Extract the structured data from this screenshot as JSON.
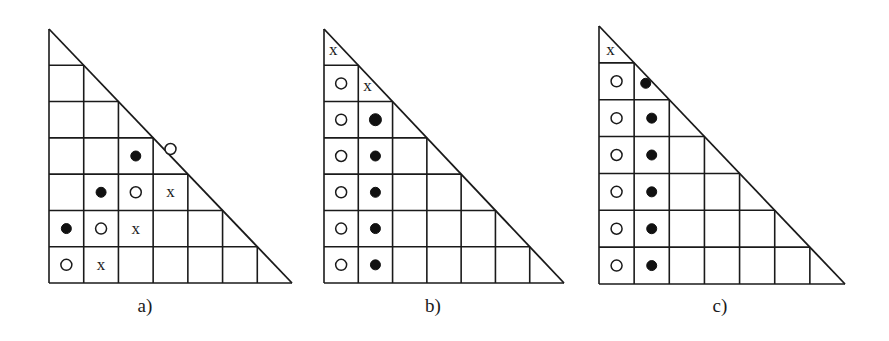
{
  "figure": {
    "colors": {
      "ink": "#1a1a1a",
      "background": "#ffffff"
    },
    "legend_symbols": {
      "open": "open-circle",
      "filled": "filled-circle",
      "x": "x"
    },
    "panels": [
      {
        "id": "a",
        "label": "a)",
        "box": {
          "x0": 49,
          "y0": 29,
          "x1": 292,
          "y1": 283
        },
        "size": 7,
        "symbols": [
          {
            "row": 3,
            "col": 2,
            "type": "filled"
          },
          {
            "row": 3,
            "col": 3,
            "type": "open",
            "dy": -7
          },
          {
            "row": 4,
            "col": 1,
            "type": "filled"
          },
          {
            "row": 4,
            "col": 2,
            "type": "open"
          },
          {
            "row": 4,
            "col": 3,
            "type": "x"
          },
          {
            "row": 5,
            "col": 0,
            "type": "filled"
          },
          {
            "row": 5,
            "col": 1,
            "type": "open"
          },
          {
            "row": 5,
            "col": 2,
            "type": "x"
          },
          {
            "row": 6,
            "col": 0,
            "type": "open"
          },
          {
            "row": 6,
            "col": 1,
            "type": "x"
          }
        ]
      },
      {
        "id": "b",
        "label": "b)",
        "box": {
          "x0": 324,
          "y0": 29,
          "x1": 564,
          "y1": 283
        },
        "size": 7,
        "symbols": [
          {
            "row": 0,
            "col": 0,
            "type": "x",
            "dx": -8,
            "dy": 3
          },
          {
            "row": 1,
            "col": 0,
            "type": "open"
          },
          {
            "row": 1,
            "col": 1,
            "type": "x",
            "dx": -8,
            "dy": 3
          },
          {
            "row": 2,
            "col": 0,
            "type": "open"
          },
          {
            "row": 2,
            "col": 1,
            "type": "filled",
            "r": 6
          },
          {
            "row": 3,
            "col": 0,
            "type": "open"
          },
          {
            "row": 3,
            "col": 1,
            "type": "filled"
          },
          {
            "row": 4,
            "col": 0,
            "type": "open"
          },
          {
            "row": 4,
            "col": 1,
            "type": "filled"
          },
          {
            "row": 5,
            "col": 0,
            "type": "open"
          },
          {
            "row": 5,
            "col": 1,
            "type": "filled"
          },
          {
            "row": 6,
            "col": 0,
            "type": "open"
          },
          {
            "row": 6,
            "col": 1,
            "type": "filled"
          }
        ]
      },
      {
        "id": "c",
        "label": "c)",
        "box": {
          "x0": 599,
          "y0": 26,
          "x1": 845,
          "y1": 284
        },
        "size": 7,
        "symbols": [
          {
            "row": 0,
            "col": 0,
            "type": "x",
            "dx": -6,
            "dy": 6
          },
          {
            "row": 1,
            "col": 0,
            "type": "open"
          },
          {
            "row": 1,
            "col": 1,
            "type": "filled",
            "dx": -6,
            "dy": 2
          },
          {
            "row": 2,
            "col": 0,
            "type": "open"
          },
          {
            "row": 2,
            "col": 1,
            "type": "filled"
          },
          {
            "row": 3,
            "col": 0,
            "type": "open"
          },
          {
            "row": 3,
            "col": 1,
            "type": "filled"
          },
          {
            "row": 4,
            "col": 0,
            "type": "open"
          },
          {
            "row": 4,
            "col": 1,
            "type": "filled"
          },
          {
            "row": 5,
            "col": 0,
            "type": "open"
          },
          {
            "row": 5,
            "col": 1,
            "type": "filled"
          },
          {
            "row": 6,
            "col": 0,
            "type": "open"
          },
          {
            "row": 6,
            "col": 1,
            "type": "filled"
          }
        ]
      }
    ],
    "labels_y": 312
  }
}
